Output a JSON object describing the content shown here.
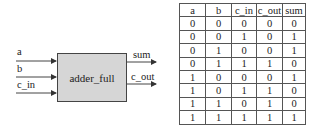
{
  "block": {
    "name": "adder_full",
    "inputs": [
      "a",
      "b",
      "c_in"
    ],
    "outputs": [
      "sum",
      "c_out"
    ],
    "fill_color": "#d6d6d6"
  },
  "truth_table": {
    "headers": [
      "a",
      "b",
      "c_in",
      "c_out",
      "sum"
    ],
    "rows": [
      [
        "0",
        "0",
        "0",
        "0",
        "0"
      ],
      [
        "0",
        "0",
        "1",
        "0",
        "1"
      ],
      [
        "0",
        "1",
        "0",
        "0",
        "1"
      ],
      [
        "0",
        "1",
        "1",
        "1",
        "0"
      ],
      [
        "1",
        "0",
        "0",
        "0",
        "1"
      ],
      [
        "1",
        "0",
        "1",
        "1",
        "0"
      ],
      [
        "1",
        "1",
        "0",
        "1",
        "0"
      ],
      [
        "1",
        "1",
        "1",
        "1",
        "1"
      ]
    ]
  }
}
